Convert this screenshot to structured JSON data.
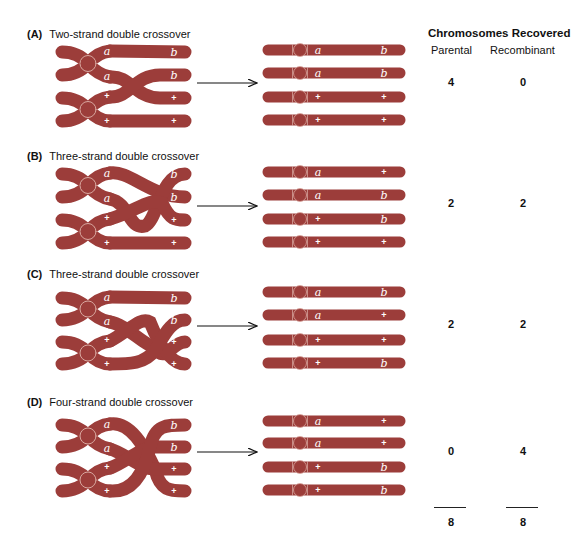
{
  "colors": {
    "chromosome": "#9c3d3a",
    "chromosome_dark": "#7e2e2c",
    "centromere_outline": "#d9a8a0",
    "text": "#111111",
    "arrow": "#111111"
  },
  "header": {
    "title": "Chromosomes Recovered",
    "col_parental": "Parental",
    "col_recombinant": "Recombinant"
  },
  "sections": [
    {
      "letter": "(A)",
      "title": "Two-strand double crossover",
      "parental": "4",
      "recombinant": "0",
      "crossover_labels": {
        "left": [
          "a",
          "a",
          "+",
          "+"
        ],
        "right": [
          "b",
          "b",
          "+",
          "+"
        ]
      },
      "products": [
        {
          "left": "a",
          "right": "b"
        },
        {
          "left": "a",
          "right": "b"
        },
        {
          "left": "+",
          "right": "+"
        },
        {
          "left": "+",
          "right": "+"
        }
      ]
    },
    {
      "letter": "(B)",
      "title": "Three-strand double crossover",
      "parental": "2",
      "recombinant": "2",
      "crossover_labels": {
        "left": [
          "a",
          "a",
          "+",
          "+"
        ],
        "right": [
          "b",
          "b",
          "+",
          "+"
        ]
      },
      "products": [
        {
          "left": "a",
          "right": "+"
        },
        {
          "left": "a",
          "right": "b"
        },
        {
          "left": "+",
          "right": "b"
        },
        {
          "left": "+",
          "right": "+"
        }
      ]
    },
    {
      "letter": "(C)",
      "title": "Three-strand double crossover",
      "parental": "2",
      "recombinant": "2",
      "crossover_labels": {
        "left": [
          "a",
          "a",
          "+",
          "+"
        ],
        "right": [
          "b",
          "b",
          "+",
          "+"
        ]
      },
      "products": [
        {
          "left": "a",
          "right": "b"
        },
        {
          "left": "a",
          "right": "+"
        },
        {
          "left": "+",
          "right": "+"
        },
        {
          "left": "+",
          "right": "b"
        }
      ]
    },
    {
      "letter": "(D)",
      "title": "Four-strand double crossover",
      "parental": "0",
      "recombinant": "4",
      "crossover_labels": {
        "left": [
          "a",
          "a",
          "+",
          "+"
        ],
        "right": [
          "b",
          "b",
          "+",
          "+"
        ]
      },
      "products": [
        {
          "left": "a",
          "right": "+"
        },
        {
          "left": "a",
          "right": "+"
        },
        {
          "left": "+",
          "right": "b"
        },
        {
          "left": "+",
          "right": "b"
        }
      ]
    }
  ],
  "totals": {
    "parental": "8",
    "recombinant": "8"
  }
}
